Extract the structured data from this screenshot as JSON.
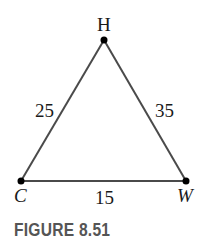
{
  "figure": {
    "caption": "FIGURE 8.51",
    "vertices": {
      "H": {
        "label": "H",
        "x": 104,
        "y": 40
      },
      "C": {
        "label": "C",
        "x": 21,
        "y": 181
      },
      "W": {
        "label": "W",
        "x": 186,
        "y": 181
      }
    },
    "sides": {
      "CH": {
        "label": "25"
      },
      "HW": {
        "label": "35"
      },
      "CW": {
        "label": "15"
      }
    },
    "colors": {
      "line": "#4a4a4a",
      "point": "#000000",
      "caption": "#555555"
    }
  }
}
